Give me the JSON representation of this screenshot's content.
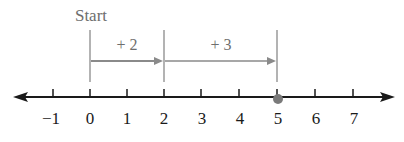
{
  "diagram": {
    "type": "number-line",
    "start_label": "Start",
    "ticks": [
      {
        "value": -1,
        "label": "−1",
        "x": 53
      },
      {
        "value": 0,
        "label": "0",
        "x": 90
      },
      {
        "value": 1,
        "label": "1",
        "x": 127
      },
      {
        "value": 2,
        "label": "2",
        "x": 164
      },
      {
        "value": 3,
        "label": "3",
        "x": 201
      },
      {
        "value": 4,
        "label": "4",
        "x": 239
      },
      {
        "value": 5,
        "label": "5",
        "x": 277
      },
      {
        "value": 6,
        "label": "6",
        "x": 315
      },
      {
        "value": 7,
        "label": "7",
        "x": 353
      }
    ],
    "jumps": [
      {
        "label": "+ 2",
        "from": 0,
        "to": 2
      },
      {
        "label": "+ 3",
        "from": 2,
        "to": 5
      }
    ],
    "result_point": 5,
    "colors": {
      "axis": "#1a1a1a",
      "jump": "#8a8a8a",
      "point": "#7a7a7a",
      "text_dark": "#1a1a1a",
      "text_gray": "#6e6e6e"
    }
  }
}
